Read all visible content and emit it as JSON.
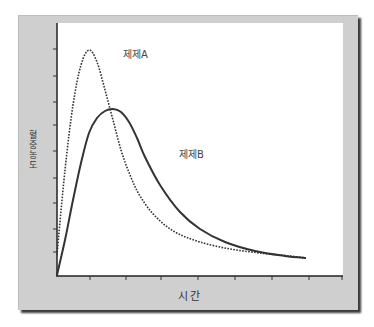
{
  "chart_data": {
    "type": "line",
    "title": "",
    "xlabel": "시간",
    "ylabel": "혈중농도",
    "x_ticks": 9,
    "y_ticks": 9,
    "tick_labels_visible": false,
    "grid": false,
    "series": [
      {
        "name": "제제A",
        "style": "dotted",
        "color": "#333333",
        "points_px": [
          [
            57,
            255
          ],
          [
            65,
            170
          ],
          [
            73,
            105
          ],
          [
            81,
            65
          ],
          [
            89,
            50
          ],
          [
            97,
            62
          ],
          [
            105,
            90
          ],
          [
            113,
            120
          ],
          [
            121,
            150
          ],
          [
            130,
            175
          ],
          [
            140,
            196
          ],
          [
            155,
            216
          ],
          [
            175,
            232
          ],
          [
            200,
            242
          ],
          [
            230,
            249
          ],
          [
            260,
            253
          ],
          [
            290,
            256
          ],
          [
            306,
            258
          ]
        ],
        "description": "rapid rise, high narrow peak early, fast decline"
      },
      {
        "name": "제제B",
        "style": "solid",
        "color": "#333333",
        "points_px": [
          [
            57,
            275
          ],
          [
            65,
            240
          ],
          [
            73,
            200
          ],
          [
            81,
            163
          ],
          [
            89,
            133
          ],
          [
            97,
            118
          ],
          [
            105,
            111
          ],
          [
            113,
            109
          ],
          [
            121,
            112
          ],
          [
            129,
            122
          ],
          [
            137,
            138
          ],
          [
            145,
            157
          ],
          [
            160,
            185
          ],
          [
            180,
            212
          ],
          [
            200,
            229
          ],
          [
            225,
            242
          ],
          [
            255,
            251
          ],
          [
            285,
            256
          ],
          [
            306,
            258
          ]
        ],
        "description": "slower rise, lower broader peak later, slower decline"
      }
    ],
    "annotations": [
      {
        "text": "제제A",
        "near": "peak of dotted curve"
      },
      {
        "text": "제제B",
        "near": "right of solid curve"
      }
    ]
  },
  "labels": {
    "x_axis": "시간",
    "y_axis_chars": [
      "혈",
      "중",
      "농",
      "도"
    ],
    "series_a": "제제A",
    "series_b": "제제B"
  }
}
